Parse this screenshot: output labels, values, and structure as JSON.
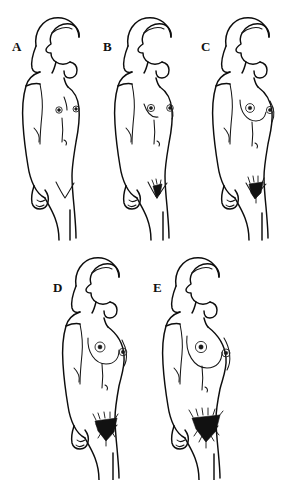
{
  "figure": {
    "style": "black-and-white line drawing",
    "background_color": "#ffffff",
    "line_color": "#0d0d0d",
    "canvas": {
      "width": 290,
      "height": 480
    },
    "layout": {
      "rows": 2,
      "row_1_count": 3,
      "row_2_count": 2,
      "row_1_labels": [
        "A",
        "B",
        "C"
      ],
      "row_2_labels": [
        "D",
        "E"
      ]
    }
  },
  "panels": [
    {
      "label": "A",
      "stage_number": 1,
      "subject": "adolescent female figure, three-quarter right-facing standing pose",
      "breast_development": "prepubertal — flat chest, elevation of papilla only",
      "areola_visible": true,
      "pubic_hair": "none",
      "hair_style": "long hair over shoulder with low ponytail",
      "label_position": {
        "x": 12,
        "y": 40
      }
    },
    {
      "label": "B",
      "stage_number": 2,
      "subject": "adolescent female figure, three-quarter right-facing standing pose",
      "breast_development": "breast bud stage — small mound, areola widening",
      "areola_visible": true,
      "pubic_hair": "sparse, lightly pigmented, small patch",
      "hair_style": "long hair over shoulder with low ponytail",
      "label_position": {
        "x": 103,
        "y": 40
      }
    },
    {
      "label": "C",
      "stage_number": 3,
      "subject": "adolescent female figure, three-quarter right-facing standing pose",
      "breast_development": "further enlargement of breast and areola, no contour separation",
      "areola_visible": true,
      "pubic_hair": "darker, coarser, spreading over pubis",
      "hair_style": "long hair over shoulder with low ponytail",
      "label_position": {
        "x": 201,
        "y": 40
      }
    },
    {
      "label": "D",
      "stage_number": 4,
      "subject": "adolescent female figure, three-quarter right-facing standing pose",
      "breast_development": "areola and papilla form secondary mound above breast level",
      "areola_visible": true,
      "pubic_hair": "adult-type in quality, dense triangle, smaller area than adult",
      "hair_style": "long hair over shoulder with low ponytail",
      "label_position": {
        "x": 53,
        "y": 281
      }
    },
    {
      "label": "E",
      "stage_number": 5,
      "subject": "adolescent female figure, three-quarter right-facing standing pose",
      "breast_development": "mature stage — projection of papilla only, areola recessed to breast contour",
      "areola_visible": true,
      "pubic_hair": "adult in quantity and type, wide inverse triangle",
      "hair_style": "long hair over shoulder with low ponytail",
      "label_position": {
        "x": 153,
        "y": 281
      }
    }
  ]
}
